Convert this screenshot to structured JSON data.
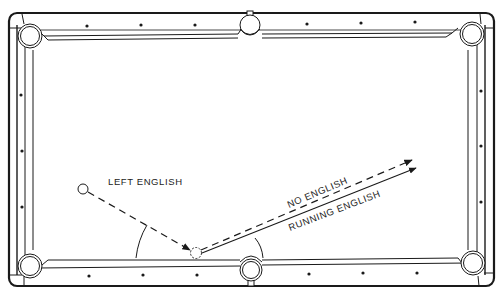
{
  "diagram": {
    "type": "pool-table-english-illustration",
    "colors": {
      "line": "#1a1a1a",
      "background": "#ffffff"
    },
    "labels": {
      "left_english": "LEFT ENGLISH",
      "no_english": "NO ENGLISH",
      "running_english": "RUNNING ENGLISH"
    },
    "pockets": [
      {
        "id": "top-left",
        "kind": "corner"
      },
      {
        "id": "top-middle",
        "kind": "side"
      },
      {
        "id": "top-right",
        "kind": "corner"
      },
      {
        "id": "bottom-left",
        "kind": "corner"
      },
      {
        "id": "bottom-middle",
        "kind": "side"
      },
      {
        "id": "bottom-right",
        "kind": "corner"
      }
    ],
    "diamonds": {
      "top_rail": 6,
      "bottom_rail": 6,
      "left_rail": 3,
      "right_rail": 3
    },
    "paths": [
      {
        "name": "cue-ball-approach",
        "style": "dashed",
        "from": "cue-ball",
        "to": "bottom-cushion-contact"
      },
      {
        "name": "no-english-rebound",
        "style": "dashed",
        "label": "NO ENGLISH"
      },
      {
        "name": "running-english-rebound",
        "style": "solid",
        "label": "RUNNING ENGLISH"
      }
    ],
    "angles": [
      {
        "name": "incidence-angle-arc"
      },
      {
        "name": "reflection-angle-arc"
      }
    ]
  }
}
